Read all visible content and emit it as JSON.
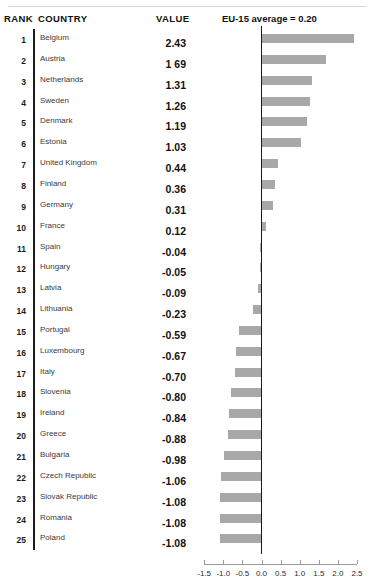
{
  "header": {
    "rank_label": "RANK",
    "country_label": "COUNTRY",
    "value_label": "VALUE",
    "note_label": "EU-15 average = 0.20"
  },
  "chart_data": {
    "type": "bar",
    "orientation": "horizontal",
    "title": "",
    "subtitle": "",
    "xlabel": "",
    "ylabel": "",
    "xlim": [
      -1.5,
      2.5
    ],
    "xticks": [
      -1.5,
      -1.0,
      -0.5,
      0.0,
      0.5,
      1.0,
      1.5,
      2.0,
      2.5
    ],
    "xticklabels": [
      "-1.5",
      "-1.0",
      "-0.5",
      "0.0",
      "0.5",
      "1.0",
      "1.5",
      "2.0",
      "2.5"
    ],
    "grid": false,
    "legend": "none",
    "annotations": [
      "EU-15 average = 0.20"
    ],
    "reference_line": 0.0,
    "bar_color": "#a8a8a8",
    "categories": [
      "Belgium",
      "Austria",
      "Netherlands",
      "Sweden",
      "Denmark",
      "Estonia",
      "United Kingdom",
      "Finland",
      "Germany",
      "France",
      "Spain",
      "Hungary",
      "Latvia",
      "Lithuania",
      "Portugal",
      "Luxembourg",
      "Italy",
      "Slovenia",
      "Ireland",
      "Greece",
      "Bulgaria",
      "Czech Republic",
      "Slovak Republic",
      "Romania",
      "Poland"
    ],
    "values": [
      2.43,
      1.69,
      1.31,
      1.26,
      1.19,
      1.03,
      0.44,
      0.36,
      0.31,
      0.12,
      -0.04,
      -0.05,
      -0.09,
      -0.23,
      -0.59,
      -0.67,
      -0.7,
      -0.8,
      -0.84,
      -0.88,
      -0.98,
      -1.06,
      -1.08,
      -1.08,
      -1.08
    ]
  },
  "rows": [
    {
      "rank": "1",
      "country": "Belgium",
      "value": "2.43"
    },
    {
      "rank": "2",
      "country": "Austria",
      "value": "1 69"
    },
    {
      "rank": "3",
      "country": "Netherlands",
      "value": "1.31"
    },
    {
      "rank": "4",
      "country": "Sweden",
      "value": "1.26"
    },
    {
      "rank": "5",
      "country": "Denmark",
      "value": "1.19"
    },
    {
      "rank": "6",
      "country": "Estonia",
      "value": "1.03"
    },
    {
      "rank": "7",
      "country": "United Kingdom",
      "value": "0.44"
    },
    {
      "rank": "8",
      "country": "Finland",
      "value": "0.36"
    },
    {
      "rank": "9",
      "country": "Germany",
      "value": "0.31"
    },
    {
      "rank": "10",
      "country": "France",
      "value": "0.12"
    },
    {
      "rank": "11",
      "country": "Spain",
      "value": "-0.04"
    },
    {
      "rank": "12",
      "country": "Hungary",
      "value": "-0.05"
    },
    {
      "rank": "13",
      "country": "Latvia",
      "value": "-0.09"
    },
    {
      "rank": "14",
      "country": "Lithuania",
      "value": "-0.23"
    },
    {
      "rank": "15",
      "country": "Portugal",
      "value": "-0.59"
    },
    {
      "rank": "16",
      "country": "Luxembourg",
      "value": "-0.67"
    },
    {
      "rank": "17",
      "country": "Italy",
      "value": "-0.70"
    },
    {
      "rank": "18",
      "country": "Slovenia",
      "value": "-0.80"
    },
    {
      "rank": "19",
      "country": "Ireland",
      "value": "-0.84"
    },
    {
      "rank": "20",
      "country": "Greece",
      "value": "-0.88"
    },
    {
      "rank": "21",
      "country": "Bulgaria",
      "value": "-0.98"
    },
    {
      "rank": "22",
      "country": "Czech Republic",
      "value": "-1.06"
    },
    {
      "rank": "23",
      "country": "Slovak Republic",
      "value": "-1.08"
    },
    {
      "rank": "24",
      "country": "Romania",
      "value": "-1.08"
    },
    {
      "rank": "25",
      "country": "Poland",
      "value": "-1.08"
    }
  ]
}
